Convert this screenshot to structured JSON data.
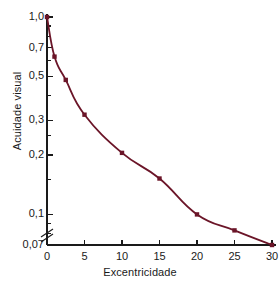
{
  "chart_data": {
    "type": "line",
    "title": "",
    "xlabel": "Excentricidade",
    "ylabel": "Acuidade visual",
    "x": [
      0,
      1,
      2.5,
      5,
      10,
      15,
      20,
      25,
      30
    ],
    "values": [
      1.0,
      0.63,
      0.48,
      0.32,
      0.205,
      0.152,
      0.1,
      0.083,
      0.07
    ],
    "series": [
      {
        "name": "Acuidade visual",
        "values": [
          1.0,
          0.63,
          0.48,
          0.32,
          0.205,
          0.152,
          0.1,
          0.083,
          0.07
        ]
      }
    ],
    "xlim": [
      0,
      30
    ],
    "ylim": [
      0.07,
      1.0
    ],
    "yscale": "log",
    "xscale": "linear",
    "grid": false,
    "legend": false,
    "y_axis_break": true,
    "line_color": "#6b1528",
    "marker": "square",
    "marker_color": "#6b1528",
    "xticks": [
      "0",
      "5",
      "10",
      "15",
      "20",
      "25",
      "30"
    ],
    "xtick_values": [
      0,
      5,
      10,
      15,
      20,
      25,
      30
    ],
    "yticks": [
      "1,0",
      "0,7",
      "0,5",
      "0,3",
      "0,2",
      "0,1",
      "0,07"
    ],
    "ytick_values": [
      1.0,
      0.7,
      0.5,
      0.3,
      0.2,
      0.1,
      0.07
    ],
    "minor_ytick_values": [
      0.9,
      0.8,
      0.6,
      0.4,
      0.25,
      0.15,
      0.09,
      0.08
    ],
    "annotations": []
  },
  "axes": {
    "y_title": "Acuidade visual",
    "x_title": "Excentricidade"
  }
}
